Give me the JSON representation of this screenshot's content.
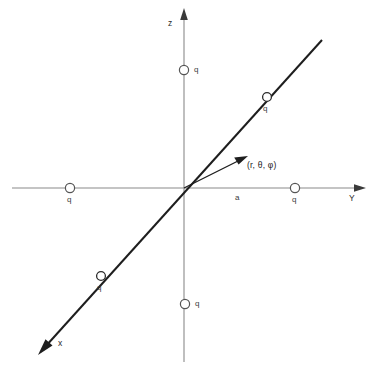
{
  "figure": {
    "background_color": "#ffffff",
    "axis_color": "#8a8a8a",
    "diagonal_color": "#1e1e1e",
    "text_color": "#2b2b2b"
  },
  "axes": [
    {
      "id": "z",
      "label": "z",
      "label_x": 168,
      "label_y": 19,
      "orientation": "vertical-up"
    },
    {
      "id": "y",
      "label": "Y",
      "label_x": 349,
      "label_y": 194,
      "orientation": "horizontal-right"
    },
    {
      "id": "x",
      "label": "x",
      "label_x": 58,
      "label_y": 339,
      "orientation": "diagonal-down-left"
    }
  ],
  "charges": [
    {
      "id": "charge-z-positive",
      "label": "q",
      "cx": 184,
      "cy": 70,
      "label_x": 194,
      "label_y": 66,
      "axis": "z"
    },
    {
      "id": "charge-z-negative",
      "label": "q",
      "cx": 185,
      "cy": 304,
      "label_x": 195,
      "label_y": 300,
      "axis": "z"
    },
    {
      "id": "charge-y-positive",
      "label": "q",
      "cx": 295,
      "cy": 188,
      "label_x": 292,
      "label_y": 196,
      "axis": "y"
    },
    {
      "id": "charge-y-negative",
      "label": "q",
      "cx": 70,
      "cy": 188,
      "label_x": 67,
      "label_y": 196,
      "axis": "y"
    },
    {
      "id": "charge-x-negative",
      "label": "q",
      "cx": 267,
      "cy": 97,
      "label_x": 263,
      "label_y": 105,
      "axis": "x"
    },
    {
      "id": "charge-x-positive",
      "label": "q",
      "cx": 101,
      "cy": 276,
      "label_x": 97,
      "label_y": 284,
      "axis": "x"
    }
  ],
  "annotations": [
    {
      "id": "field-point-label",
      "text": "(r, θ, φ)",
      "x": 247,
      "y": 161
    },
    {
      "id": "distance-label",
      "text": "a",
      "x": 235,
      "y": 194
    }
  ],
  "vector": {
    "id": "position-vector",
    "from_x": 184,
    "from_y": 188,
    "to_x": 245,
    "to_y": 157
  }
}
